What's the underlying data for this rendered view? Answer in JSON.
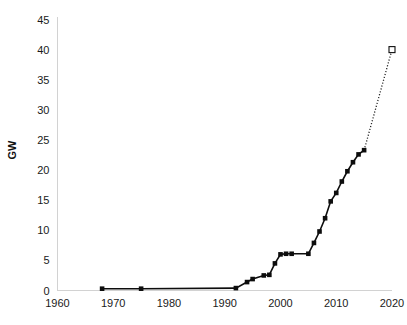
{
  "chart_data": {
    "type": "line",
    "title": "",
    "xlabel": "",
    "ylabel": "GW",
    "xlim": [
      1960,
      2020
    ],
    "ylim": [
      0,
      45
    ],
    "xticks": [
      1960,
      1970,
      1980,
      1990,
      2000,
      2010,
      2020
    ],
    "yticks": [
      0,
      5,
      10,
      15,
      20,
      25,
      30,
      35,
      40,
      45
    ],
    "grid": false,
    "legend": null,
    "series": [
      {
        "name": "installed capacity",
        "marker": "filled-square",
        "linestyle": "solid",
        "points": [
          [
            1968,
            0.3
          ],
          [
            1975,
            0.3
          ],
          [
            1992,
            0.4
          ],
          [
            1994,
            1.4
          ],
          [
            1995,
            1.9
          ],
          [
            1997,
            2.5
          ],
          [
            1998,
            2.6
          ],
          [
            1999,
            4.5
          ],
          [
            2000,
            6.0
          ],
          [
            2001,
            6.1
          ],
          [
            2002,
            6.1
          ],
          [
            2005,
            6.1
          ],
          [
            2006,
            7.9
          ],
          [
            2007,
            9.8
          ],
          [
            2008,
            12.0
          ],
          [
            2009,
            14.8
          ],
          [
            2010,
            16.2
          ],
          [
            2011,
            18.1
          ],
          [
            2012,
            19.8
          ],
          [
            2013,
            21.3
          ],
          [
            2014,
            22.6
          ],
          [
            2015,
            23.3
          ]
        ]
      },
      {
        "name": "projection",
        "marker": "open-square",
        "linestyle": "dotted",
        "points": [
          [
            2015,
            23.3
          ],
          [
            2020,
            40.0
          ]
        ]
      }
    ]
  },
  "axes": {
    "y_label": "GW",
    "y_tick_labels": [
      "0",
      "5",
      "10",
      "15",
      "20",
      "25",
      "30",
      "35",
      "40",
      "45"
    ],
    "x_tick_labels": [
      "1960",
      "1970",
      "1980",
      "1990",
      "2000",
      "2010",
      "2020"
    ]
  },
  "colors": {
    "line": "#0d0d0d",
    "axis": "#d2d2d2",
    "text": "#1a1a1a",
    "background": "#ffffff"
  }
}
